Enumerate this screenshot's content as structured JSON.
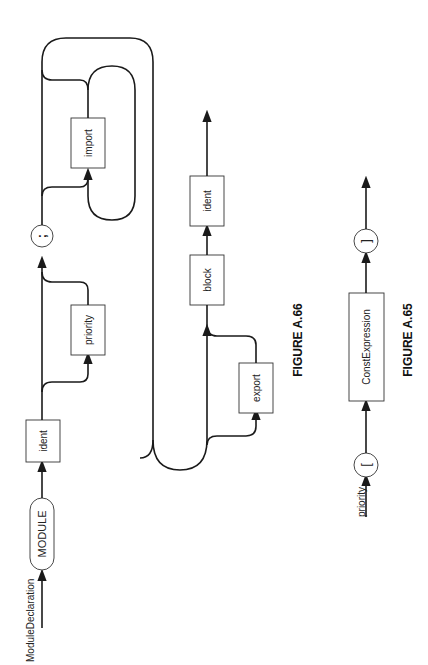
{
  "figures": [
    {
      "id": "A.66",
      "caption": "FIGURE A.66",
      "start_label": "ModuleDeclaration",
      "nodes": {
        "module": "MODULE",
        "ident1": "ident",
        "priority": "priority",
        "semicolon": ";",
        "import": "import",
        "export": "export",
        "block": "block",
        "ident2": "ident"
      }
    },
    {
      "id": "A.65",
      "caption": "FIGURE A.65",
      "start_label": "priority",
      "nodes": {
        "lbracket": "[",
        "constexpr": "ConstExpression",
        "rbracket": "]"
      }
    }
  ],
  "orientation": "rotated 90° counter-clockwise"
}
